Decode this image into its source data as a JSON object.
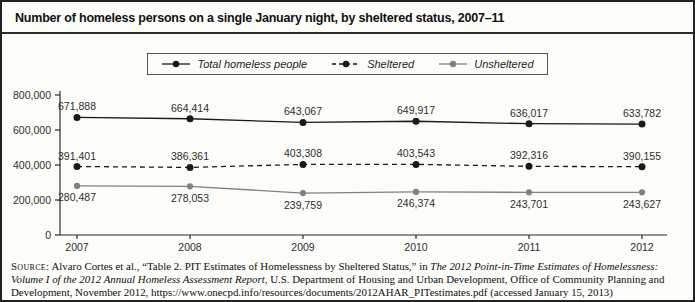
{
  "header": {
    "title": "Number of homeless persons on a single January night, by sheltered status, 2007–11"
  },
  "chart_data": {
    "type": "line",
    "title": "Number of homeless persons on a single January night, by sheltered status, 2007–11",
    "categories": [
      "2007",
      "2008",
      "2009",
      "2010",
      "2011",
      "2012"
    ],
    "xlabel": "",
    "ylabel": "",
    "ylim": [
      0,
      800000
    ],
    "yticks": [
      {
        "value": 0,
        "label": "0"
      },
      {
        "value": 200000,
        "label": "200,000"
      },
      {
        "value": 400000,
        "label": "400,000"
      },
      {
        "value": 600000,
        "label": "600,000"
      },
      {
        "value": 800000,
        "label": "800,000"
      }
    ],
    "grid": false,
    "legend_position": "top-center",
    "series": [
      {
        "id": "total",
        "name": "Total homeless people",
        "values": [
          671888,
          664414,
          643067,
          649917,
          636017,
          633782
        ],
        "labels": [
          "671,888",
          "664,414",
          "643,067",
          "649,917",
          "636,017",
          "633,782"
        ],
        "color": "#1a1a1a",
        "dash": null,
        "marker": "circle",
        "marker_r": 3.5,
        "label_position": "above"
      },
      {
        "id": "sheltered",
        "name": "Sheltered",
        "values": [
          391401,
          386361,
          403308,
          403543,
          392316,
          390155
        ],
        "labels": [
          "391,401",
          "386,361",
          "403,308",
          "403,543",
          "392,316",
          "390,155"
        ],
        "color": "#1a1a1a",
        "dash": "5,4",
        "marker": "circle",
        "marker_r": 3.5,
        "label_position": "above"
      },
      {
        "id": "unsheltered",
        "name": "Unsheltered",
        "values": [
          280487,
          278053,
          239759,
          246374,
          243701,
          243627
        ],
        "labels": [
          "280,487",
          "278,053",
          "239,759",
          "246,374",
          "243,701",
          "243,627"
        ],
        "color": "#818181",
        "dash": null,
        "marker": "circle",
        "marker_r": 3.1,
        "label_position": "below"
      }
    ]
  },
  "source": {
    "segments": [
      {
        "text": "Source:",
        "style": "smallcaps"
      },
      {
        "text": " Alvaro Cortes et al., “Table 2. PIT Estimates of Homelessness by Sheltered Status,” in ",
        "style": "normal"
      },
      {
        "text": "The 2012 Point-in-Time Estimates of Homelessness: Volume I of the 2012 Annual Homeless Assessment Report",
        "style": "italic"
      },
      {
        "text": ", U.S. Department of Housing and Urban Development, Office of Community Planning and Development, November 2012, https://www.onecpd.info/resources/documents/2012AHAR_PITestimates.pdf (accessed January 15, 2013)",
        "style": "normal"
      }
    ]
  }
}
